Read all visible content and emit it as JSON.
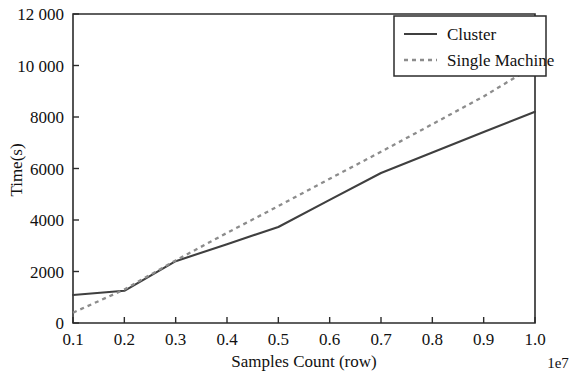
{
  "chart_data": {
    "type": "line",
    "title": "",
    "xlabel": "Samples Count (row)",
    "ylabel": "Time(s)",
    "x_offset_text": "1e7",
    "xlim": [
      0.1,
      1.0
    ],
    "ylim": [
      0,
      12000
    ],
    "grid": false,
    "legend_position": "top-right",
    "x": [
      0.1,
      0.2,
      0.3,
      0.4,
      0.5,
      0.6,
      0.7,
      0.8,
      0.9,
      1.0
    ],
    "xticklabels": [
      "0.1",
      "0.2",
      "0.3",
      "0.4",
      "0.5",
      "0.6",
      "0.7",
      "0.8",
      "0.9",
      "1.0"
    ],
    "yticks": [
      0,
      2000,
      4000,
      6000,
      8000,
      10000,
      12000
    ],
    "yticklabels": [
      "0",
      "2000",
      "4000",
      "6000",
      "8000",
      "10 000",
      "12 000"
    ],
    "series": [
      {
        "name": "Cluster",
        "style": "solid",
        "color": "#3f3f3f",
        "values": [
          1090,
          1250,
          2400,
          3060,
          3730,
          4780,
          5825,
          6620,
          7420,
          8200
        ]
      },
      {
        "name": "Single Machine",
        "style": "dotted",
        "color": "#8c8c8c",
        "values": [
          400,
          1300,
          2430,
          3500,
          4540,
          5600,
          6650,
          7720,
          8800,
          10000
        ]
      }
    ]
  },
  "legend": {
    "entries": [
      {
        "label": "Cluster",
        "marker": "solid-line-swatch"
      },
      {
        "label": "Single Machine",
        "marker": "dotted-line-swatch"
      }
    ]
  },
  "axes": {
    "y_ticks": [
      {
        "value": 0,
        "label": "0"
      },
      {
        "value": 2000,
        "label": "2000"
      },
      {
        "value": 4000,
        "label": "4000"
      },
      {
        "value": 6000,
        "label": "6000"
      },
      {
        "value": 8000,
        "label": "8000"
      },
      {
        "value": 10000,
        "label": "10 000"
      },
      {
        "value": 12000,
        "label": "12 000"
      }
    ],
    "x_ticks": [
      {
        "value": 0.1,
        "label": "0.1"
      },
      {
        "value": 0.2,
        "label": "0.2"
      },
      {
        "value": 0.3,
        "label": "0.3"
      },
      {
        "value": 0.4,
        "label": "0.4"
      },
      {
        "value": 0.5,
        "label": "0.5"
      },
      {
        "value": 0.6,
        "label": "0.6"
      },
      {
        "value": 0.7,
        "label": "0.7"
      },
      {
        "value": 0.8,
        "label": "0.8"
      },
      {
        "value": 0.9,
        "label": "0.9"
      },
      {
        "value": 1.0,
        "label": "1.0"
      }
    ],
    "x_title": "Samples Count (row)",
    "y_title": "Time(s)",
    "x_offset": "1e7"
  }
}
